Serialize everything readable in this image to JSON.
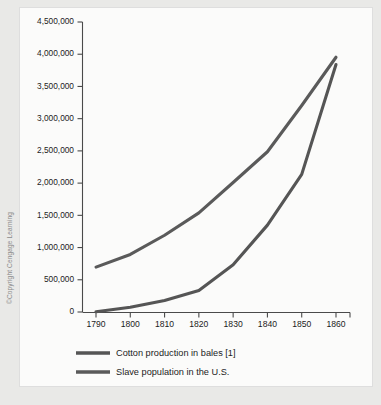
{
  "figure": {
    "copyright": "©Copyright Cengage Learning",
    "panel_color": "#fbfbfa",
    "background_color": "#e9e9e7"
  },
  "chart_data": {
    "type": "line",
    "title": "",
    "subtitle": "",
    "xlabel": "",
    "ylabel": "",
    "x": [
      1790,
      1800,
      1810,
      1820,
      1830,
      1840,
      1850,
      1860
    ],
    "xlim": [
      1790,
      1860
    ],
    "ylim": [
      0,
      4500000
    ],
    "grid": false,
    "legend_position": "bottom-left",
    "xticks": [
      "1790",
      "1800",
      "1810",
      "1820",
      "1830",
      "1840",
      "1850",
      "1860"
    ],
    "yticks": [
      "0",
      "500,000",
      "1,000,000",
      "1,500,000",
      "2,000,000",
      "2,500,000",
      "3,000,000",
      "3,500,000",
      "4,000,000",
      "4,500,000"
    ],
    "ytick_values": [
      0,
      500000,
      1000000,
      1500000,
      2000000,
      2500000,
      3000000,
      3500000,
      4000000,
      4500000
    ],
    "series": [
      {
        "name": "Cotton production in bales [1]",
        "color": "#555555",
        "values": [
          3000,
          73000,
          178000,
          335000,
          732000,
          1348000,
          2136000,
          3841000
        ]
      },
      {
        "name": "Slave population in the U.S.",
        "color": "#5a5a5a",
        "values": [
          697000,
          893000,
          1191000,
          1538000,
          2009000,
          2487000,
          3204000,
          3953000
        ]
      }
    ]
  },
  "legend": {
    "items": [
      {
        "label": "Cotton production in bales [1]",
        "color": "#555555"
      },
      {
        "label": "Slave population in the U.S.",
        "color": "#5a5a5a"
      }
    ]
  }
}
